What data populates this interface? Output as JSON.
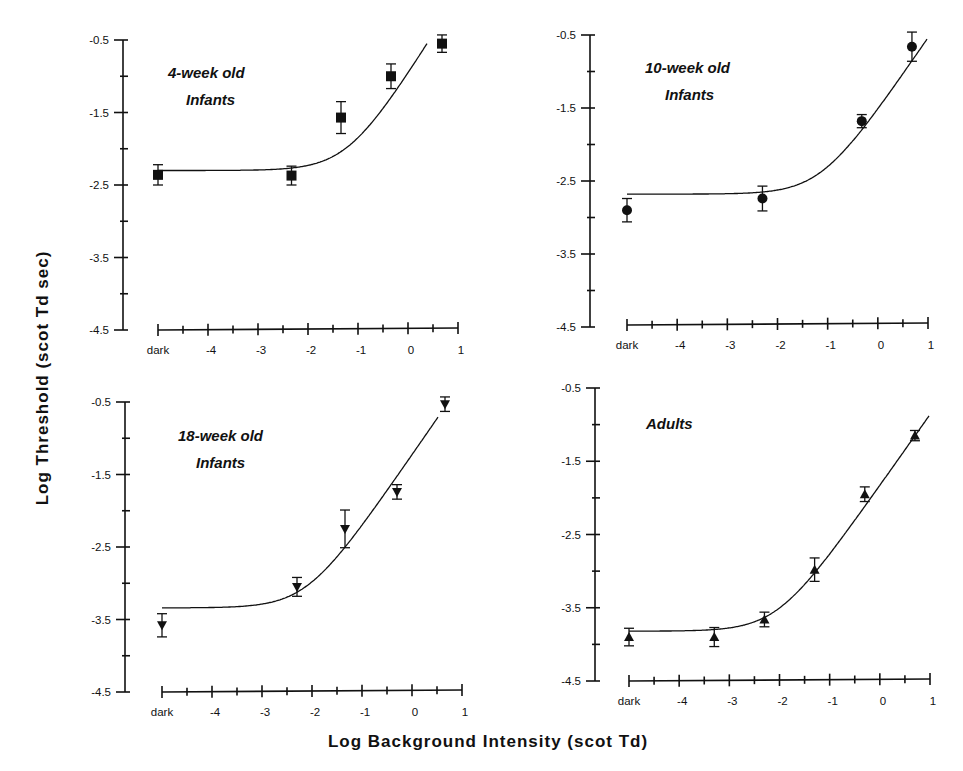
{
  "figure": {
    "ylabel": "Log Threshold (scot Td sec)",
    "xlabel": "Log Background Intensity (scot Td)"
  },
  "chart_data": [
    {
      "type": "scatter",
      "title": "4-week old Infants",
      "title_lines": [
        "4-week old",
        "Infants"
      ],
      "marker": "square",
      "xlabel": "Log Background Intensity (scot Td)",
      "ylabel": "Log Threshold (scot Td sec)",
      "xticks": [
        "dark",
        "-4",
        "-3",
        "-2",
        "-1",
        "0",
        "1"
      ],
      "yticks": [
        "-0.5",
        "-1.5",
        "-2.5",
        "-3.5",
        "-4.5"
      ],
      "xlim": [
        -5,
        1
      ],
      "ylim": [
        -4.5,
        -0.5
      ],
      "x": [
        "dark",
        -2.33,
        -1.34,
        -0.34,
        0.68
      ],
      "y": [
        -2.36,
        -2.37,
        -1.57,
        -1.0,
        -0.55
      ],
      "yerr": [
        0.14,
        0.13,
        0.22,
        0.17,
        0.12
      ],
      "fit": {
        "base": -2.3,
        "knee": -1.2,
        "slope": 1.1,
        "x_end": 0.38
      }
    },
    {
      "type": "scatter",
      "title": "10-week old Infants",
      "title_lines": [
        "10-week old",
        "Infants"
      ],
      "marker": "circle",
      "xlabel": "Log Background Intensity (scot Td)",
      "ylabel": "Log Threshold (scot Td sec)",
      "xticks": [
        "dark",
        "-4",
        "-3",
        "-2",
        "-1",
        "0",
        "1"
      ],
      "yticks": [
        "-0.5",
        "-1.5",
        "-2.5",
        "-3.5",
        "-4.5"
      ],
      "xlim": [
        -5,
        1
      ],
      "ylim": [
        -4.5,
        -0.5
      ],
      "x": [
        "dark",
        -2.3,
        -0.32,
        0.68
      ],
      "y": [
        -2.9,
        -2.74,
        -1.68,
        -0.66
      ],
      "yerr": [
        0.16,
        0.17,
        0.09,
        0.2
      ],
      "fit": {
        "base": -2.68,
        "knee": -1.14,
        "slope": 1.0,
        "x_end": 0.98
      }
    },
    {
      "type": "scatter",
      "title": "18-week old Infants",
      "title_lines": [
        "18-week old",
        "Infants"
      ],
      "marker": "triangle-down",
      "xlabel": "Log Background Intensity (scot Td)",
      "ylabel": "Log Threshold (scot Td sec)",
      "xticks": [
        "dark",
        "-4",
        "-3",
        "-2",
        "-1",
        "0",
        "1"
      ],
      "yticks": [
        "-0.5",
        "-1.5",
        "-2.5",
        "-3.5",
        "-4.5"
      ],
      "xlim": [
        -5,
        1
      ],
      "ylim": [
        -4.5,
        -0.5
      ],
      "x": [
        "dark",
        -2.3,
        -1.34,
        -0.3,
        0.66
      ],
      "y": [
        -3.58,
        -3.05,
        -2.25,
        -1.74,
        -0.53
      ],
      "yerr": [
        0.16,
        0.13,
        0.26,
        0.1,
        0.1
      ],
      "fit": {
        "base": -3.34,
        "knee": -2.11,
        "slope": 1.0,
        "x_end": 0.52
      }
    },
    {
      "type": "scatter",
      "title": "Adults",
      "title_lines": [
        "Adults"
      ],
      "marker": "triangle-up",
      "xlabel": "Log Background Intensity (scot Td)",
      "ylabel": "Log Threshold (scot Td sec)",
      "xticks": [
        "dark",
        "-4",
        "-3",
        "-2",
        "-1",
        "0",
        "1"
      ],
      "yticks": [
        "-0.5",
        "-1.5",
        "-2.5",
        "-3.5",
        "-4.5"
      ],
      "xlim": [
        -5,
        1
      ],
      "ylim": [
        -4.5,
        -0.5
      ],
      "x": [
        "dark",
        -3.3,
        -2.3,
        -1.3,
        -0.3,
        0.7
      ],
      "y": [
        -3.9,
        -3.9,
        -3.66,
        -2.98,
        -1.95,
        -1.15
      ],
      "yerr": [
        0.12,
        0.13,
        0.1,
        0.16,
        0.1,
        0.07
      ],
      "fit": {
        "base": -3.82,
        "knee": -2.05,
        "slope": 0.97,
        "x_end": 0.98
      }
    }
  ]
}
